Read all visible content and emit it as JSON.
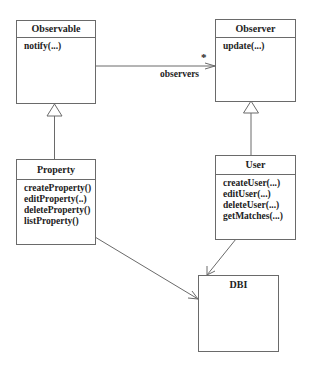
{
  "diagram": {
    "type": "UML class diagram",
    "classes": {
      "observable": {
        "name": "Observable",
        "operations": [
          "notify(...)"
        ]
      },
      "observer": {
        "name": "Observer",
        "operations": [
          "update(...)"
        ]
      },
      "property": {
        "name": "Property",
        "operations": [
          "createProperty()",
          "editProperty(..)",
          "deleteProperty()",
          "listProperty()"
        ]
      },
      "user": {
        "name": "User",
        "operations": [
          "createUser(...)",
          "editUser(...)",
          "deleteUser(...)",
          "getMatches(...)"
        ]
      },
      "dbi": {
        "name": "DBI",
        "operations": []
      }
    },
    "relationships": [
      {
        "type": "association",
        "from": "Observable",
        "to": "Observer",
        "role": "observers",
        "multiplicity": "*"
      },
      {
        "type": "generalization",
        "from": "Property",
        "to": "Observable"
      },
      {
        "type": "generalization",
        "from": "User",
        "to": "Observer"
      },
      {
        "type": "dependency",
        "from": "Property",
        "to": "DBI"
      },
      {
        "type": "dependency",
        "from": "User",
        "to": "DBI"
      }
    ],
    "association_label": "observers",
    "multiplicity_label": "*",
    "colors": {
      "line": "#6a6a6a",
      "text": "#222222",
      "background": "#ffffff"
    }
  }
}
